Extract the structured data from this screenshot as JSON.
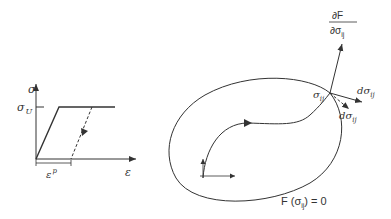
{
  "stress_strain_plot": {
    "y_axis_label": "σ",
    "x_axis_label": "ε",
    "yield_label": "σ",
    "yield_sub": "U",
    "plastic_strain_label": "ε",
    "plastic_strain_sup": "p"
  },
  "yield_surface": {
    "surface_label_prefix": "F (σ",
    "surface_label_sub": "ij",
    "surface_label_suffix": ") = 0",
    "point_label": "σ",
    "point_sub": "ij",
    "normal_numerator": "∂F",
    "normal_denominator": "∂σ",
    "normal_den_sub": "ij",
    "increment_label": "dσ",
    "increment_sub": "ij",
    "increment2_label": "dσ",
    "increment2_sub": "ij"
  },
  "colors": {
    "line": "#333333",
    "background": "#ffffff"
  }
}
